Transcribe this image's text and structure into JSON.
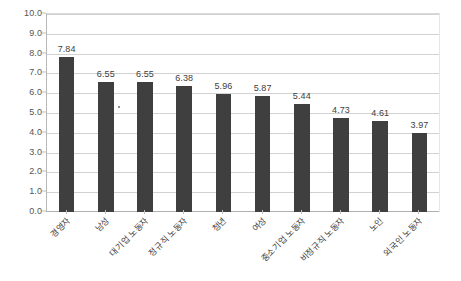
{
  "chart_data": {
    "type": "bar",
    "title": "",
    "subtitle": "",
    "xlabel": "",
    "ylabel": "",
    "ylim": [
      0.0,
      10.0
    ],
    "ytick_step": 1.0,
    "ytick_labels": [
      "0.0",
      "1.0",
      "2.0",
      "3.0",
      "4.0",
      "5.0",
      "6.0",
      "7.0",
      "8.0",
      "9.0",
      "10.0"
    ],
    "ytick_values": [
      0.0,
      1.0,
      2.0,
      3.0,
      4.0,
      5.0,
      6.0,
      7.0,
      8.0,
      9.0,
      10.0
    ],
    "grid": true,
    "grid_axis": "y",
    "legend": false,
    "legend_position": "none",
    "bar_color": "#3f3f3f",
    "gridline_color": "#d2d2d2",
    "label_color": "#404040",
    "categories": [
      "경영자",
      "남성",
      "대기업 노동자",
      "정규직 노동자",
      "청년",
      "여성",
      "중소기업 노동자",
      "비정규직 노동자",
      "노인",
      "외국인 노동자"
    ],
    "values": [
      7.84,
      6.55,
      6.55,
      6.38,
      5.96,
      5.87,
      5.44,
      4.73,
      4.61,
      3.97
    ],
    "value_labels": [
      "7.84",
      "6.55",
      "6.55",
      "6.38",
      "5.96",
      "5.87",
      "5.44",
      "4.73",
      "4.61",
      "3.97"
    ]
  }
}
